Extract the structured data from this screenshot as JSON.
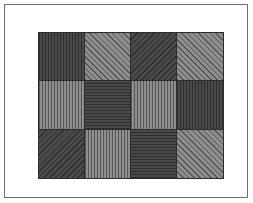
{
  "page": {
    "background_color": "#ffffff",
    "width": 253,
    "height": 203
  },
  "frame": {
    "border_color": "#6f6f6f",
    "inset": 4
  },
  "palette": {
    "dark_fill": "#4a4a4a",
    "light_fill": "#8e8e8e",
    "hatch_on_dark": "#2e2e2e",
    "hatch_on_light": "#565656",
    "cell_border": "#2c2c2c"
  },
  "chart_data": {
    "type": "heatmap",
    "title": "",
    "xlabel": "",
    "ylabel": "",
    "rows": 3,
    "columns": 4,
    "legend_position": "none",
    "grid": true,
    "categories": [
      "col-1",
      "col-2",
      "col-3",
      "col-4"
    ],
    "row_labels": [
      "row-1",
      "row-2",
      "row-3"
    ],
    "cells": [
      {
        "row": 0,
        "col": 0,
        "shade": "dark",
        "pattern": "vertical",
        "fill": "#4a4a4a"
      },
      {
        "row": 0,
        "col": 1,
        "shade": "light",
        "pattern": "diagonal-up",
        "fill": "#8e8e8e"
      },
      {
        "row": 0,
        "col": 2,
        "shade": "dark",
        "pattern": "diagonal-down",
        "fill": "#4a4a4a"
      },
      {
        "row": 0,
        "col": 3,
        "shade": "light",
        "pattern": "diagonal-up",
        "fill": "#8e8e8e"
      },
      {
        "row": 1,
        "col": 0,
        "shade": "light",
        "pattern": "vertical",
        "fill": "#8e8e8e"
      },
      {
        "row": 1,
        "col": 1,
        "shade": "dark",
        "pattern": "horizontal",
        "fill": "#4a4a4a"
      },
      {
        "row": 1,
        "col": 2,
        "shade": "light",
        "pattern": "vertical",
        "fill": "#8e8e8e"
      },
      {
        "row": 1,
        "col": 3,
        "shade": "dark",
        "pattern": "vertical",
        "fill": "#4a4a4a"
      },
      {
        "row": 2,
        "col": 0,
        "shade": "dark",
        "pattern": "diagonal-down",
        "fill": "#4a4a4a"
      },
      {
        "row": 2,
        "col": 1,
        "shade": "light",
        "pattern": "vertical",
        "fill": "#8e8e8e"
      },
      {
        "row": 2,
        "col": 2,
        "shade": "dark",
        "pattern": "horizontal",
        "fill": "#4a4a4a"
      },
      {
        "row": 2,
        "col": 3,
        "shade": "light",
        "pattern": "diagonal-up",
        "fill": "#8e8e8e"
      }
    ]
  }
}
